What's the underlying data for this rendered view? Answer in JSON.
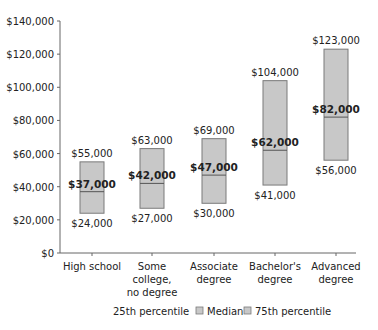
{
  "chart_data": {
    "type": "box",
    "title": "",
    "xlabel": "",
    "ylabel": "",
    "ylim": [
      0,
      140000
    ],
    "yticks": [
      0,
      20000,
      40000,
      60000,
      80000,
      100000,
      120000,
      140000
    ],
    "ytick_labels": [
      "$0",
      "$20,000",
      "$40,000",
      "$60,000",
      "$80,000",
      "$100,000",
      "$120,000",
      "$140,000"
    ],
    "grid": false,
    "categories": [
      [
        "High school"
      ],
      [
        "Some",
        "college,",
        "no degree"
      ],
      [
        "Associate",
        "degree"
      ],
      [
        "Bachelor's",
        "degree"
      ],
      [
        "Advanced",
        "degree"
      ]
    ],
    "series": [
      {
        "name": "25th percentile",
        "values": [
          24000,
          27000,
          30000,
          41000,
          56000
        ],
        "labels": [
          "$24,000",
          "$27,000",
          "$30,000",
          "$41,000",
          "$56,000"
        ]
      },
      {
        "name": "Median",
        "values": [
          37000,
          42000,
          47000,
          62000,
          82000
        ],
        "labels": [
          "$37,000",
          "$42,000",
          "$47,000",
          "$62,000",
          "$82,000"
        ]
      },
      {
        "name": "75th percentile",
        "values": [
          55000,
          63000,
          69000,
          104000,
          123000
        ],
        "labels": [
          "$55,000",
          "$63,000",
          "$69,000",
          "$104,000",
          "$123,000"
        ]
      }
    ],
    "legend": {
      "position": "bottom",
      "entries": [
        "25th percentile",
        "Median",
        "75th percentile"
      ]
    },
    "colors": {
      "box_fill": "#c8c8c8",
      "box_stroke": "#7a7a7a",
      "median_line": "#555555",
      "axis": "#666666",
      "text": "#222222"
    }
  }
}
